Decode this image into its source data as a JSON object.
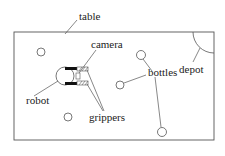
{
  "diagram": {
    "title": "",
    "labels": {
      "table": "table",
      "camera": "camera",
      "bottles": "bottles",
      "depot": "depot",
      "robot": "robot",
      "grippers": "grippers"
    },
    "table_rect": {
      "x": 14,
      "y": 32,
      "width": 200,
      "height": 108
    },
    "bottles": [
      {
        "cx": 41,
        "cy": 52,
        "r": 4
      },
      {
        "cx": 141,
        "cy": 55,
        "r": 4.5
      },
      {
        "cx": 120,
        "cy": 85,
        "r": 4
      },
      {
        "cx": 68,
        "cy": 117,
        "r": 4
      },
      {
        "cx": 162,
        "cy": 132,
        "r": 4.5
      }
    ],
    "depot": {
      "cx": 214,
      "cy": 32,
      "r": 21
    },
    "colors": {
      "stroke": "#555555",
      "text": "#222222",
      "robot_bar": "#111111"
    }
  }
}
